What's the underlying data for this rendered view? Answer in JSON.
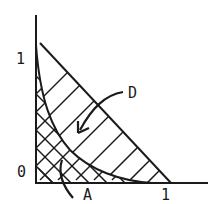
{
  "figure": {
    "y_axis_tick_label": "1",
    "origin_label": "0",
    "x_axis_tick_label": "1",
    "region_d_label": "D",
    "region_a_label": "A"
  },
  "colors": {
    "ink": "#1a1a1a",
    "background": "#ffffff"
  }
}
